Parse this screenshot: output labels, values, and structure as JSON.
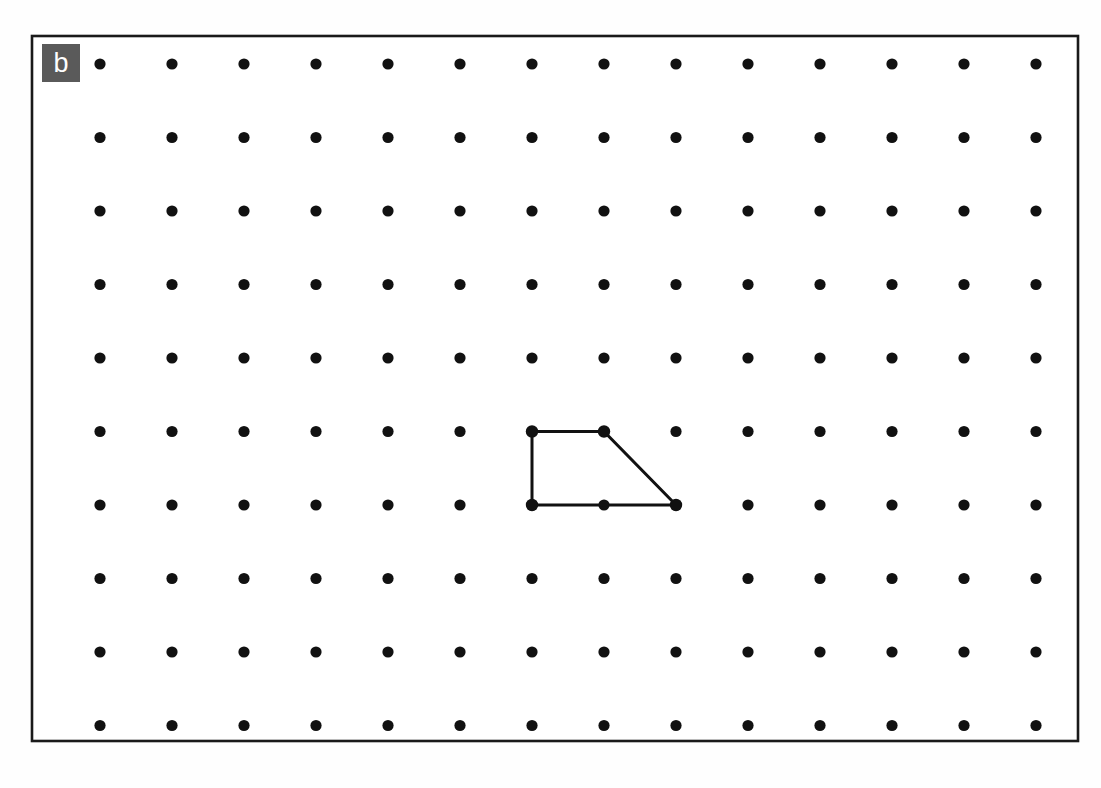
{
  "figure": {
    "type": "dot-grid-geometry-figure",
    "panel_label": "b",
    "background_color": "#fefefe",
    "frame": {
      "name": "figure-border",
      "x": 32,
      "y": 36,
      "width": 1046,
      "height": 705,
      "stroke_color": "#1a1a1a",
      "stroke_width": 2.6,
      "fill": "#ffffff"
    },
    "label_box": {
      "x": 42,
      "y": 44,
      "width": 38,
      "height": 38,
      "background_color": "#5a5a5a",
      "text_color": "#ffffff",
      "font_size_px": 27
    }
  },
  "chart_data": {
    "type": "scatter",
    "title": "",
    "subtitle": "",
    "xlabel": "",
    "ylabel": "",
    "grid": false,
    "legend": null,
    "annotations": [
      "b"
    ],
    "dot_grid": {
      "columns": 14,
      "rows": 10,
      "origin_x": 100,
      "origin_y": 64,
      "spacing_x": 72,
      "spacing_y": 73.5,
      "dot_radius": 5.6,
      "dot_color": "#111111",
      "x": [
        100,
        172,
        244,
        316,
        388,
        460,
        532,
        604,
        676,
        748,
        820,
        892,
        964,
        1036
      ],
      "y": [
        64,
        137.5,
        211,
        284.5,
        358,
        431.5,
        505,
        578.5,
        652,
        725.5
      ]
    },
    "polygon": {
      "name": "trapezoid",
      "closed": true,
      "stroke_color": "#111111",
      "stroke_width": 3.0,
      "fill": "none",
      "vertex_grid_indices": [
        {
          "col": 6,
          "row": 5
        },
        {
          "col": 7,
          "row": 5
        },
        {
          "col": 8,
          "row": 6
        },
        {
          "col": 6,
          "row": 6
        }
      ],
      "vertex_points": [
        {
          "x": 532,
          "y": 431.5
        },
        {
          "x": 604,
          "y": 431.5
        },
        {
          "x": 676,
          "y": 505
        },
        {
          "x": 532,
          "y": 505
        }
      ],
      "vertex_marker_radius": 6.2
    }
  }
}
